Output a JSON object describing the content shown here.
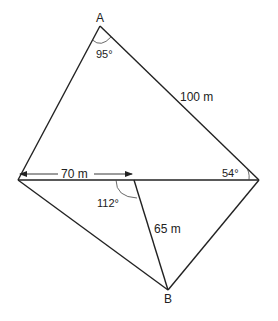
{
  "diagram": {
    "type": "geometry-quadrilateral",
    "vertices": {
      "A": {
        "label": "A"
      },
      "B": {
        "label": "B"
      }
    },
    "labels": {
      "angle_A": "95°",
      "side_AR": "100 m",
      "side_LJ": "70 m",
      "angle_R": "54°",
      "angle_J": "112°",
      "side_JB": "65 m"
    },
    "colors": {
      "line": "#222222",
      "background": "#ffffff"
    }
  }
}
